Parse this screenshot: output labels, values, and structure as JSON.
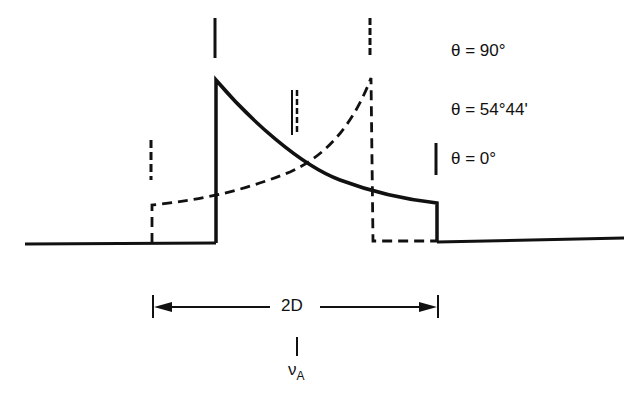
{
  "diagram": {
    "legend": [
      {
        "label": "θ = 90°",
        "style": "dashed",
        "marker_x": 373
      },
      {
        "label": "θ = 54°44'",
        "style": "double-solid-dashed",
        "marker_x": 295
      },
      {
        "label": "θ = 0°",
        "style": "solid",
        "marker_x": 437
      }
    ],
    "span_label": "2D",
    "center_label": "ν",
    "center_subscript": "A",
    "colors": {
      "line": "#111111",
      "background": "#ffffff"
    }
  }
}
